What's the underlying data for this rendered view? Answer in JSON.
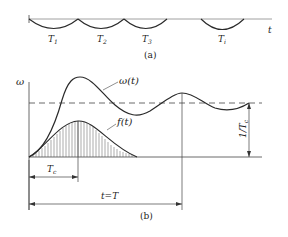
{
  "figure_a": {
    "axis_label": "t",
    "intervals": [
      "T",
      "T",
      "T",
      "T"
    ],
    "interval_subscripts": [
      "1",
      "2",
      "3",
      "i"
    ],
    "caption": "(a)"
  },
  "figure_b": {
    "y_axis_label": "ω",
    "curve_omega_label": "ω(t)",
    "curve_f_label": "f(t)",
    "tc_label": "T",
    "tc_subscript": "c",
    "t_equals_label": "t=T",
    "right_dim_label": "1/T",
    "right_dim_subscript": "c",
    "caption": "(b)"
  },
  "colors": {
    "stroke": "#2a2a2a",
    "background": "#ffffff"
  }
}
